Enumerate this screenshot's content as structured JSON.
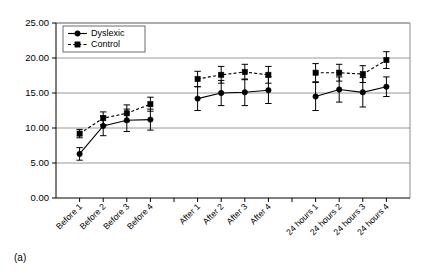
{
  "panel": {
    "caption": "(a)"
  },
  "legend": {
    "position": "top-left-inside",
    "entries": [
      {
        "label": "Dyslexic",
        "marker": "circle",
        "line": "solid"
      },
      {
        "label": "Control",
        "marker": "square",
        "line": "dashed"
      }
    ]
  },
  "chart_data": {
    "type": "line",
    "title": "",
    "xlabel": "",
    "ylabel": "",
    "ylim": [
      0,
      25
    ],
    "yticks": [
      0,
      5,
      10,
      15,
      20,
      25
    ],
    "ytick_labels": [
      "0.00",
      "5.00",
      "10.00",
      "15.00",
      "20.00",
      "25.00"
    ],
    "grid": true,
    "grid_axis": "y",
    "categories": [
      "Before 1",
      "Before 2",
      "Before 3",
      "Before 4",
      "After 1",
      "After 2",
      "After 3",
      "After 4",
      "24 hours 1",
      "24 hours 2",
      "24 hours 3",
      "24 hours 4"
    ],
    "groups": [
      {
        "name": "Before",
        "categories": [
          "Before 1",
          "Before 2",
          "Before 3",
          "Before 4"
        ]
      },
      {
        "name": "After",
        "categories": [
          "After 1",
          "After 2",
          "After 3",
          "After 4"
        ]
      },
      {
        "name": "24 hours",
        "categories": [
          "24 hours 1",
          "24 hours 2",
          "24 hours 3",
          "24 hours 4"
        ]
      }
    ],
    "series": [
      {
        "name": "Dyslexic",
        "marker": "circle",
        "line": "solid",
        "values": [
          6.3,
          10.3,
          11.1,
          11.2,
          14.2,
          15.0,
          15.1,
          15.4,
          14.5,
          15.5,
          15.1,
          15.9
        ],
        "errors": [
          0.9,
          1.4,
          1.6,
          1.5,
          1.7,
          1.8,
          1.9,
          1.9,
          2.0,
          1.8,
          2.1,
          1.4
        ]
      },
      {
        "name": "Control",
        "marker": "square",
        "line": "dashed",
        "values": [
          9.2,
          11.4,
          12.1,
          13.4,
          17.0,
          17.6,
          18.0,
          17.6,
          17.9,
          17.9,
          17.7,
          19.7
        ],
        "errors": [
          0.6,
          0.9,
          1.2,
          1.0,
          1.1,
          1.2,
          1.1,
          1.2,
          1.3,
          1.2,
          1.2,
          1.2
        ]
      }
    ]
  }
}
